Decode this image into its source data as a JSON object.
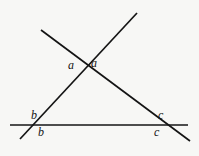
{
  "figure": {
    "background_color": "#f7f7f5",
    "stroke_color": "#141414",
    "stroke_width": 1.7,
    "width": 199,
    "height": 156,
    "lines": [
      {
        "name": "ascending-line",
        "description": "line rising from lower-left to upper-right",
        "x1": 20,
        "y1": 139,
        "x2": 137,
        "y2": 13
      },
      {
        "name": "descending-line",
        "description": "line falling from upper-left to lower-right",
        "x1": 41,
        "y1": 30,
        "x2": 190,
        "y2": 141
      },
      {
        "name": "horizontal-line",
        "description": "horizontal transversal near the bottom",
        "x1": 10,
        "y1": 125,
        "x2": 188,
        "y2": 125
      }
    ],
    "vertices": [
      {
        "name": "top-vertex",
        "x": 88,
        "y": 66
      },
      {
        "name": "left-vertex",
        "x": 36,
        "y": 125
      },
      {
        "name": "right-vertex",
        "x": 157,
        "y": 125
      }
    ]
  },
  "labels": {
    "a_left": "a",
    "a_right": "a",
    "b_top": "b",
    "b_bottom": "b",
    "c_top": "c",
    "c_bottom": "c"
  }
}
